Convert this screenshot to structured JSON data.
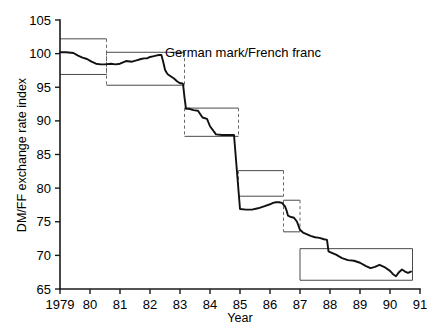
{
  "figure": {
    "annotation_label": "German mark/French franc",
    "y_axis_title": "DM/FF exchange rate index",
    "x_axis_title": "Year",
    "line_color": "#111111",
    "band_color": "#4a4a4a",
    "background_color": "#ffffff"
  },
  "chart_data": {
    "type": "line",
    "title": "German mark/French franc",
    "xlabel": "Year",
    "ylabel": "DM/FF exchange rate index",
    "xlim": [
      1979,
      1991
    ],
    "ylim": [
      65,
      105
    ],
    "grid": false,
    "legend": "none",
    "x_tick_labels": [
      "1979",
      "80",
      "81",
      "82",
      "83",
      "84",
      "85",
      "86",
      "87",
      "88",
      "89",
      "90",
      "91"
    ],
    "x_tick_values": [
      1979,
      1980,
      1981,
      1982,
      1983,
      1984,
      1985,
      1986,
      1987,
      1988,
      1989,
      1990,
      1991
    ],
    "y_tick_labels": [
      "65",
      "70",
      "75",
      "80",
      "85",
      "90",
      "95",
      "100",
      "105"
    ],
    "y_tick_values": [
      65,
      70,
      75,
      80,
      85,
      90,
      95,
      100,
      105
    ],
    "series": [
      {
        "name": "DM/FF exchange rate index",
        "x": [
          1979.0,
          1979.2,
          1979.45,
          1979.6,
          1979.75,
          1979.9,
          1980.05,
          1980.2,
          1980.35,
          1980.5,
          1980.7,
          1980.85,
          1981.0,
          1981.2,
          1981.4,
          1981.55,
          1981.7,
          1981.8,
          1981.9,
          1982.0,
          1982.1,
          1982.2,
          1982.3,
          1982.38,
          1982.45,
          1982.5,
          1982.55,
          1982.6,
          1982.7,
          1982.8,
          1982.9,
          1983.0,
          1983.05,
          1983.1,
          1983.15,
          1983.2,
          1983.3,
          1983.45,
          1983.6,
          1983.75,
          1983.9,
          1984.0,
          1984.2,
          1984.4,
          1984.6,
          1984.8,
          1985.0,
          1985.2,
          1985.4,
          1985.6,
          1985.8,
          1986.0,
          1986.1,
          1986.2,
          1986.3,
          1986.4,
          1986.5,
          1986.55,
          1986.6,
          1986.7,
          1986.8,
          1986.9,
          1987.0,
          1987.1,
          1987.2,
          1987.35,
          1987.5,
          1987.65,
          1987.8,
          1987.9,
          1987.95,
          1988.0,
          1988.2,
          1988.4,
          1988.6,
          1988.8,
          1989.0,
          1989.2,
          1989.35,
          1989.5,
          1989.65,
          1989.8,
          1990.0,
          1990.1,
          1990.2,
          1990.3,
          1990.4,
          1990.5,
          1990.6,
          1990.7
        ],
        "y": [
          100.2,
          100.2,
          100.1,
          99.7,
          99.4,
          99.2,
          98.8,
          98.5,
          98.4,
          98.4,
          98.5,
          98.4,
          98.5,
          98.9,
          98.8,
          99.0,
          99.2,
          99.3,
          99.3,
          99.5,
          99.6,
          99.7,
          99.8,
          99.8,
          98.6,
          97.6,
          97.2,
          96.9,
          96.6,
          96.3,
          95.9,
          95.6,
          95.6,
          95.5,
          93.5,
          91.8,
          91.8,
          91.6,
          91.5,
          90.5,
          90.3,
          89.2,
          88.0,
          87.9,
          87.9,
          87.9,
          76.9,
          76.8,
          76.8,
          77.0,
          77.3,
          77.6,
          77.8,
          77.9,
          77.9,
          77.8,
          77.3,
          76.7,
          75.9,
          75.7,
          75.6,
          75.0,
          73.8,
          73.4,
          73.2,
          72.9,
          72.7,
          72.6,
          72.4,
          72.3,
          70.6,
          70.5,
          70.1,
          69.6,
          69.3,
          69.2,
          68.9,
          68.4,
          68.1,
          68.3,
          68.6,
          68.3,
          67.7,
          67.2,
          66.9,
          67.5,
          67.9,
          67.6,
          67.4,
          67.6
        ]
      }
    ],
    "target_bands": [
      {
        "start": 1979.0,
        "end": 1980.55,
        "upper": 102.2,
        "lower": 96.9,
        "realignment_dashed": true
      },
      {
        "start": 1980.55,
        "end": 1983.15,
        "upper": 100.2,
        "lower": 95.3,
        "realignment_dashed": true
      },
      {
        "start": 1983.15,
        "end": 1984.95,
        "upper": 91.9,
        "lower": 87.7,
        "realignment_dashed": true
      },
      {
        "start": 1984.95,
        "end": 1986.45,
        "upper": 82.6,
        "lower": 78.8,
        "realignment_dashed": true
      },
      {
        "start": 1986.45,
        "end": 1987.0,
        "upper": 78.2,
        "lower": 73.5,
        "realignment_dashed": true
      },
      {
        "start": 1987.0,
        "end": 1990.75,
        "upper": 71.0,
        "lower": 66.3,
        "realignment_dashed": false
      }
    ]
  }
}
